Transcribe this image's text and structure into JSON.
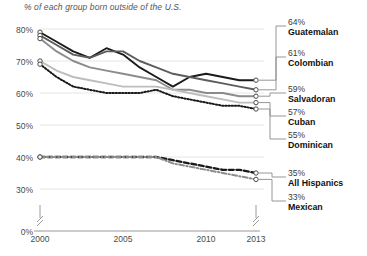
{
  "subtitle": "% of each group born outside of the U.S.",
  "axis": {
    "y_ticks": [
      "80%",
      "70%",
      "60%",
      "50%",
      "40%",
      "30%",
      "0%"
    ],
    "x_ticks": [
      "2000",
      "2005",
      "2010",
      "2013"
    ],
    "y_break": true,
    "x_break": true
  },
  "legend": [
    {
      "value": "64%",
      "name": "Guatemalan"
    },
    {
      "value": "61%",
      "name": "Colombian"
    },
    {
      "value": "59%",
      "name": "Salvadoran"
    },
    {
      "value": "57%",
      "name": "Cuban"
    },
    {
      "value": "55%",
      "name": "Dominican"
    },
    {
      "value": "35%",
      "name": "All Hispanics"
    },
    {
      "value": "33%",
      "name": "Mexican"
    }
  ],
  "chart_data": {
    "type": "line",
    "title": "",
    "subtitle": "% of each group born outside of the U.S.",
    "xlabel": "",
    "ylabel": "",
    "xlim": [
      2000,
      2013
    ],
    "ylim": [
      28,
      82
    ],
    "grid": true,
    "legend_position": "right",
    "x": [
      2000,
      2001,
      2002,
      2003,
      2004,
      2005,
      2006,
      2007,
      2008,
      2009,
      2010,
      2011,
      2012,
      2013
    ],
    "series": [
      {
        "name": "Guatemalan",
        "color": "#1a1a1a",
        "style": "solid",
        "end_label": "64%",
        "values": [
          79,
          76,
          73,
          71,
          74,
          72,
          68,
          65,
          62,
          65,
          66,
          65,
          64,
          64
        ]
      },
      {
        "name": "Colombian",
        "color": "#5d5d5d",
        "style": "solid",
        "end_label": "61%",
        "values": [
          78,
          75,
          72,
          71,
          73,
          73,
          70,
          68,
          66,
          65,
          64,
          63,
          62,
          61
        ]
      },
      {
        "name": "Salvadoran",
        "color": "#8c8c8c",
        "style": "solid",
        "end_label": "59%",
        "values": [
          77,
          73,
          70,
          68,
          67,
          66,
          65,
          64,
          61,
          61,
          60,
          60,
          59,
          59
        ]
      },
      {
        "name": "Cuban",
        "color": "#bdbdbd",
        "style": "solid",
        "end_label": "57%",
        "values": [
          70,
          67,
          65,
          64,
          63,
          62,
          62,
          62,
          61,
          60,
          59,
          58,
          57,
          57
        ]
      },
      {
        "name": "Dominican",
        "color": "#1a1a1a",
        "style": "dotted",
        "end_label": "55%",
        "values": [
          69,
          65,
          62,
          61,
          60,
          60,
          60,
          61,
          59,
          58,
          57,
          56,
          56,
          55
        ]
      },
      {
        "name": "All Hispanics",
        "color": "#1a1a1a",
        "style": "dashed",
        "end_label": "35%",
        "values": [
          40,
          40,
          40,
          40,
          40,
          40,
          40,
          40,
          39,
          38,
          37,
          36,
          36,
          35
        ]
      },
      {
        "name": "Mexican",
        "color": "#8c8c8c",
        "style": "dashdot",
        "end_label": "33%",
        "values": [
          40,
          40,
          40,
          40,
          40,
          40,
          40,
          40,
          38,
          37,
          36,
          35,
          34,
          33
        ]
      }
    ]
  }
}
